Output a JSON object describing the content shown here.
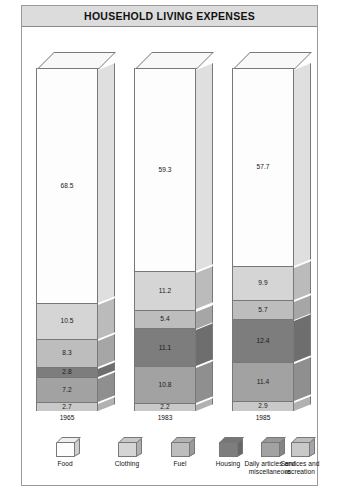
{
  "title": "HOUSEHOLD LIVING EXPENSES",
  "chart_data": {
    "type": "bar",
    "subtype": "stacked-3d-column",
    "title": "HOUSEHOLD LIVING EXPENSES",
    "xlabel": "",
    "ylabel": "Composition of expenditure (%)",
    "ylim": [
      0,
      100
    ],
    "grid": false,
    "legend_position": "bottom",
    "categories": [
      "1965",
      "1983",
      "1985"
    ],
    "series": [
      {
        "name": "Food",
        "values": [
          68.5,
          59.3,
          57.7
        ],
        "color": "#fdfdfd"
      },
      {
        "name": "Clothing",
        "values": [
          10.5,
          11.2,
          9.9
        ],
        "color": "#d5d5d5"
      },
      {
        "name": "Fuel",
        "values": [
          8.3,
          5.4,
          5.7
        ],
        "color": "#bdbdbd"
      },
      {
        "name": "Housing",
        "values": [
          2.8,
          11.1,
          12.4
        ],
        "color": "#7d7d7d"
      },
      {
        "name": "Daily articles and miscellaneous",
        "values": [
          7.2,
          10.8,
          11.4
        ],
        "color": "#a2a2a2"
      },
      {
        "name": "Services and recreation",
        "values": [
          2.7,
          2.2,
          2.9
        ],
        "color": "#c9c9c9"
      }
    ]
  },
  "legend": {
    "items": [
      {
        "label": "Food",
        "color": "#fdfdfd"
      },
      {
        "label": "Clothing",
        "color": "#d5d5d5"
      },
      {
        "label": "Fuel",
        "color": "#bdbdbd"
      },
      {
        "label": "Housing",
        "color": "#7d7d7d"
      },
      {
        "label": "Daily articles and miscellaneous",
        "color": "#a2a2a2"
      },
      {
        "label": "Services and recreation",
        "color": "#c9c9c9"
      }
    ]
  },
  "colors": {
    "title_bar_bg": "#dcdcdc",
    "frame_border": "#9a9a9a",
    "segment_border": "#787878",
    "text": "#111111"
  }
}
